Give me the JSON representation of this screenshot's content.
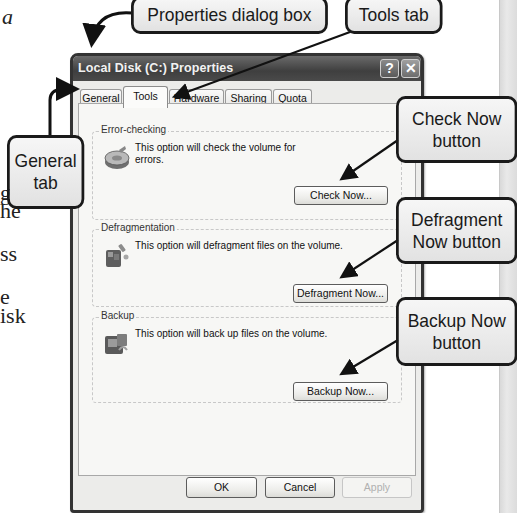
{
  "page_fragments": [
    {
      "text": "a",
      "italic": true
    },
    {
      "text": "g",
      "italic": false
    },
    {
      "text": "he",
      "italic": false
    },
    {
      "text": "ss",
      "italic": false
    },
    {
      "text": "e",
      "italic": false
    },
    {
      "text": "isk",
      "italic": false
    }
  ],
  "callouts": {
    "properties_dialog": "Properties dialog box",
    "tools_tab": "Tools tab",
    "general_tab": {
      "line1": "General",
      "line2": "tab"
    },
    "check_now": {
      "line1": "Check Now",
      "line2": "button"
    },
    "defragment_now": {
      "line1": "Defragment",
      "line2": "Now button"
    },
    "backup_now": {
      "line1": "Backup Now",
      "line2": "button"
    }
  },
  "dialog": {
    "title": "Local Disk (C:) Properties",
    "help_glyph": "?",
    "close_glyph": "✕",
    "tabs": [
      {
        "label": "General",
        "active": false
      },
      {
        "label": "Tools",
        "active": true
      },
      {
        "label": "Hardware",
        "active": false
      },
      {
        "label": "Sharing",
        "active": false
      },
      {
        "label": "Quota",
        "active": false
      }
    ],
    "groups": {
      "error_checking": {
        "label": "Error-checking",
        "description": "This option will check the volume for errors.",
        "button": "Check Now...",
        "icon": "disk-check-icon"
      },
      "defragmentation": {
        "label": "Defragmentation",
        "description": "This option will defragment files on the volume.",
        "button": "Defragment Now...",
        "icon": "defragment-icon"
      },
      "backup": {
        "label": "Backup",
        "description": "This option will back up files on the volume.",
        "button": "Backup Now...",
        "icon": "backup-icon"
      }
    },
    "footer": {
      "ok": "OK",
      "cancel": "Cancel",
      "apply": "Apply"
    }
  }
}
